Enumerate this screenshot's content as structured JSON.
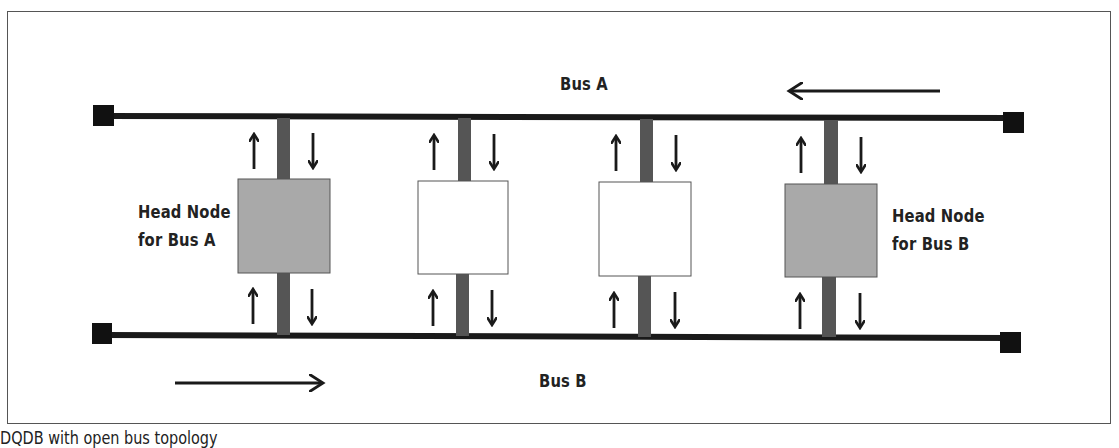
{
  "diagram": {
    "buses": [
      {
        "label": "Bus A",
        "direction": "right-to-left"
      },
      {
        "label": "Bus B",
        "direction": "left-to-right"
      }
    ],
    "nodes": [
      {
        "role": "head",
        "label_line1": "Head Node",
        "label_line2": "for Bus A",
        "fill": "#a9a9a9"
      },
      {
        "role": "station",
        "fill": "#ffffff"
      },
      {
        "role": "station",
        "fill": "#ffffff"
      },
      {
        "role": "head",
        "label_line1": "Head Node",
        "label_line2": "for Bus B",
        "fill": "#a9a9a9"
      }
    ],
    "colors": {
      "bus_line": "#1a1a1a",
      "stub": "#555555",
      "head_node": "#a9a9a9",
      "station_node": "#ffffff",
      "terminator": "#111111"
    }
  },
  "caption": "DQDB with open bus topology"
}
